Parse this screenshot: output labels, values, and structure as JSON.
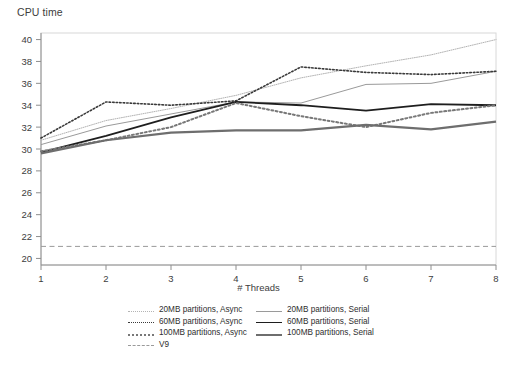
{
  "axes": {
    "y_title": "CPU time",
    "x_title": "# Threads",
    "y_ticks": [
      "40",
      "38",
      "36",
      "34",
      "32",
      "30",
      "28",
      "26",
      "24",
      "22",
      "20"
    ],
    "x_ticks": [
      "1",
      "2",
      "3",
      "4",
      "5",
      "6",
      "7",
      "8"
    ]
  },
  "legend": {
    "items": [
      {
        "label": "20MB partitions, Async",
        "style": "dotted",
        "width": 1.0,
        "color": "#b4b4b4"
      },
      {
        "label": "20MB partitions, Serial",
        "style": "solid",
        "width": 1.0,
        "color": "#9a9a9a"
      },
      {
        "label": "60MB partitions, Async",
        "style": "dotted",
        "width": 1.6,
        "color": "#3a3a3a"
      },
      {
        "label": "60MB partitions, Serial",
        "style": "solid",
        "width": 1.8,
        "color": "#1e1e1e"
      },
      {
        "label": "100MB partitions, Async",
        "style": "dotted",
        "width": 2.0,
        "color": "#787878"
      },
      {
        "label": "100MB partitions, Serial",
        "style": "solid",
        "width": 2.2,
        "color": "#6e6e6e"
      },
      {
        "label": "V9",
        "style": "dashed",
        "width": 1.0,
        "color": "#9a9a9a"
      }
    ]
  },
  "chart_data": {
    "type": "line",
    "title": "",
    "xlabel": "# Threads",
    "ylabel": "CPU time",
    "x": [
      1,
      2,
      3,
      4,
      5,
      6,
      7,
      8
    ],
    "xlim": [
      1,
      8
    ],
    "ylim": [
      19.4,
      40.6
    ],
    "grid": false,
    "legend_position": "bottom",
    "series": [
      {
        "name": "20MB partitions, Async",
        "style": "dotted",
        "width": 1.0,
        "color": "#b4b4b4",
        "values": [
          30.8,
          32.6,
          33.7,
          34.9,
          36.5,
          37.6,
          38.6,
          40.0
        ]
      },
      {
        "name": "20MB partitions, Serial",
        "style": "solid",
        "width": 1.0,
        "color": "#9a9a9a",
        "values": [
          30.4,
          32.1,
          33.2,
          34.3,
          34.2,
          35.9,
          36.0,
          37.1
        ]
      },
      {
        "name": "60MB partitions, Async",
        "style": "dotted",
        "width": 1.6,
        "color": "#3a3a3a",
        "values": [
          31.0,
          34.3,
          34.0,
          34.4,
          37.5,
          37.0,
          36.8,
          37.1
        ]
      },
      {
        "name": "60MB partitions, Serial",
        "style": "solid",
        "width": 1.8,
        "color": "#1e1e1e",
        "values": [
          29.7,
          31.2,
          32.9,
          34.3,
          34.0,
          33.5,
          34.1,
          34.0
        ]
      },
      {
        "name": "100MB partitions, Async",
        "style": "dotted",
        "width": 2.0,
        "color": "#787878",
        "values": [
          29.8,
          30.8,
          32.0,
          34.2,
          33.0,
          32.0,
          33.3,
          34.0
        ]
      },
      {
        "name": "100MB partitions, Serial",
        "style": "solid",
        "width": 2.2,
        "color": "#6e6e6e",
        "values": [
          29.6,
          30.8,
          31.5,
          31.7,
          31.7,
          32.2,
          31.8,
          32.5
        ]
      },
      {
        "name": "V9",
        "style": "dashed",
        "width": 1.0,
        "color": "#9a9a9a",
        "values": [
          21.1,
          21.1,
          21.1,
          21.1,
          21.1,
          21.1,
          21.1,
          21.1
        ]
      }
    ]
  }
}
